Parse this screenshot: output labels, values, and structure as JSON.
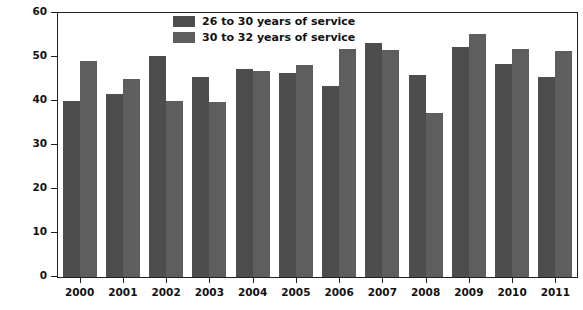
{
  "chart_data": {
    "type": "bar",
    "title": "",
    "xlabel": "",
    "ylabel": "Percentage of personnel remaining in the military",
    "categories": [
      "2000",
      "2001",
      "2002",
      "2003",
      "2004",
      "2005",
      "2006",
      "2007",
      "2008",
      "2009",
      "2010",
      "2011"
    ],
    "series": [
      {
        "name": "26 to 30 years of service",
        "color": "#4d4d4d",
        "values": [
          40.1,
          41.5,
          50.3,
          45.5,
          47.3,
          46.4,
          43.5,
          53.2,
          46.0,
          52.3,
          48.4,
          45.5
        ]
      },
      {
        "name": "30 to 32 years of service",
        "color": "#5e5e5e",
        "values": [
          49.0,
          45.0,
          40.1,
          39.7,
          46.9,
          48.1,
          51.8,
          51.7,
          37.3,
          55.2,
          51.9,
          51.3
        ]
      }
    ],
    "ylim": [
      0,
      60
    ],
    "yticks": [
      0,
      10,
      20,
      30,
      40,
      50,
      60
    ],
    "ytick_labels": [
      "0",
      "10",
      "20",
      "30",
      "40",
      "50",
      "60"
    ],
    "grid": false,
    "legend_position": "top-center"
  },
  "axes": {
    "y_title": "Percentage of personnel remaining in the military"
  },
  "legend": {
    "items": [
      {
        "label": "26 to 30 years of service"
      },
      {
        "label": "30 to 32 years of service"
      }
    ]
  }
}
